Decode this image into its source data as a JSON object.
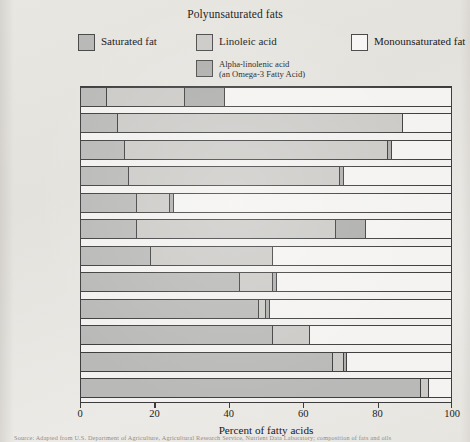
{
  "legend": {
    "title": "Polyunsaturated fats",
    "items": [
      {
        "key": "saturated",
        "label": "Saturated fat",
        "color": "#b9b9b7"
      },
      {
        "key": "linoleic",
        "label": "Linoleic acid",
        "color": "#cbcac7"
      },
      {
        "key": "mono",
        "label": "Monounsaturated fat",
        "color": "#f4f3f1"
      },
      {
        "key": "alinolenic",
        "label": "Alpha-linolenic acid\n(an Omega-3 Fatty Acid)",
        "color": "#aeaeac"
      }
    ]
  },
  "axis": {
    "xlabel": "Percent of fatty acids",
    "ticks": [
      "0",
      "20",
      "40",
      "60",
      "80",
      "100"
    ],
    "min": 0,
    "max": 100
  },
  "footnote": "Source: Adapted from U.S. Department of Agriculture, Agricultural Research Service, Nutrient Data Laboratory; composition of fats and oils",
  "chart_data": {
    "type": "bar",
    "orientation": "horizontal",
    "stacked": true,
    "title": "Polyunsaturated fats",
    "xlabel": "Percent of fatty acids",
    "ylabel": "",
    "xlim": [
      0,
      100
    ],
    "grid": false,
    "legend_position": "top",
    "categories": [
      "Canola oil",
      "Safflower oil",
      "Sunflower oil",
      "Corn oil",
      "Olive oil",
      "Soybean oil",
      "Peanut oil",
      "Lard*",
      "Beef tallow*",
      "Palm oil",
      "Butterfat*",
      "Coconut oil"
    ],
    "series": [
      {
        "name": "Saturated fat",
        "values": [
          7,
          10,
          12,
          13,
          15,
          15,
          19,
          43,
          48,
          52,
          68,
          92
        ]
      },
      {
        "name": "Linoleic acid",
        "values": [
          21,
          77,
          71,
          57,
          9,
          54,
          33,
          9,
          2,
          10,
          3,
          2
        ]
      },
      {
        "name": "Alpha-linolenic acid",
        "values": [
          11,
          0,
          1,
          1,
          1,
          8,
          0,
          1,
          1,
          0,
          1,
          0
        ]
      },
      {
        "name": "Monounsaturated fat",
        "values": [
          61,
          13,
          16,
          29,
          75,
          23,
          48,
          47,
          49,
          38,
          28,
          6
        ]
      }
    ]
  },
  "rows": [
    {
      "label": "Canola oil",
      "saturated": 7,
      "linoleic": 21,
      "alinolenic": 11,
      "mono": 61
    },
    {
      "label": "Safflower oil",
      "saturated": 10,
      "linoleic": 77,
      "alinolenic": 0,
      "mono": 13
    },
    {
      "label": "Sunflower oil",
      "saturated": 12,
      "linoleic": 71,
      "alinolenic": 1,
      "mono": 16
    },
    {
      "label": "Corn oil",
      "saturated": 13,
      "linoleic": 57,
      "alinolenic": 1,
      "mono": 29
    },
    {
      "label": "Olive oil",
      "saturated": 15,
      "linoleic": 9,
      "alinolenic": 1,
      "mono": 75
    },
    {
      "label": "Soybean oil",
      "saturated": 15,
      "linoleic": 54,
      "alinolenic": 8,
      "mono": 23
    },
    {
      "label": "Peanut oil",
      "saturated": 19,
      "linoleic": 33,
      "alinolenic": 0,
      "mono": 48
    },
    {
      "label": "Lard*",
      "saturated": 43,
      "linoleic": 9,
      "alinolenic": 1,
      "mono": 47
    },
    {
      "label": "Beef tallow*",
      "saturated": 48,
      "linoleic": 2,
      "alinolenic": 1,
      "mono": 49
    },
    {
      "label": "Palm oil",
      "saturated": 52,
      "linoleic": 10,
      "alinolenic": 0,
      "mono": 38
    },
    {
      "label": "Butterfat*",
      "saturated": 68,
      "linoleic": 3,
      "alinolenic": 1,
      "mono": 28
    },
    {
      "label": "Coconut oil",
      "saturated": 92,
      "linoleic": 2,
      "alinolenic": 0,
      "mono": 6
    }
  ]
}
